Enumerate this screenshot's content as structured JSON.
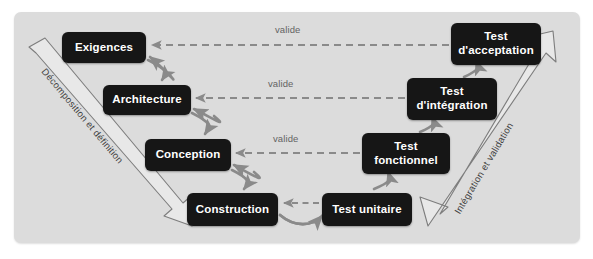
{
  "diagram": {
    "panel_color": "#dcdcdc",
    "node_color": "#161616",
    "node_text_color": "#ffffff",
    "arrow_color": "#8a8a8a",
    "band_stroke_color": "#7d7d7d",
    "band_fill_color": "#e8e8e8"
  },
  "left_band": {
    "label": "Décomposition et définition"
  },
  "right_band": {
    "label": "Intégration et validation"
  },
  "nodes": {
    "exigences": {
      "label": "Exigences"
    },
    "architecture": {
      "label": "Architecture"
    },
    "conception": {
      "label": "Conception"
    },
    "construction": {
      "label": "Construction"
    },
    "test_unitaire": {
      "label": "Test unitaire"
    },
    "test_fonctionnel": {
      "label": "Test\nfonctionnel"
    },
    "test_integration": {
      "label": "Test\nd'intégration"
    },
    "test_acceptation": {
      "label": "Test\nd'acceptation"
    }
  },
  "validation_links": [
    {
      "label": "valide"
    },
    {
      "label": "valide"
    },
    {
      "label": "valide"
    }
  ]
}
